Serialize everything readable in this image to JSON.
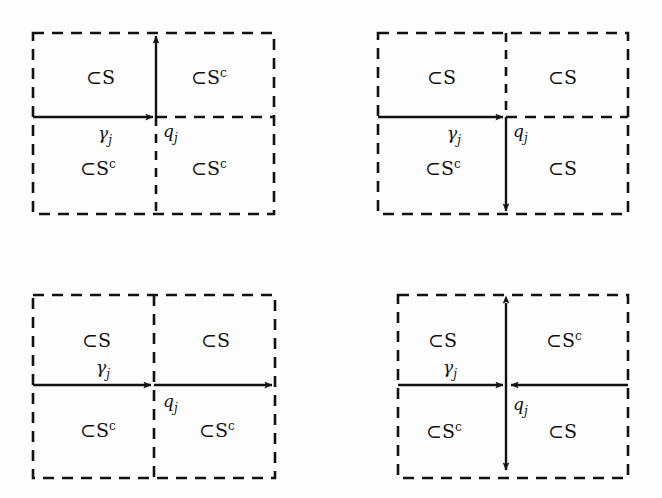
{
  "figure": {
    "caption": "",
    "background_color": "#fdfdfd",
    "ink_color": "#121212",
    "symbols": {
      "subset_in_s": "⊂S",
      "subset_in_s_complement": "⊂S",
      "complement_exponent": "c",
      "curve_label": "γ",
      "curve_subscript": "j",
      "point_label": "q",
      "point_subscript": "j"
    },
    "panels": [
      {
        "id": "panel-1",
        "position": "top-left",
        "quadrants": {
          "top_left": "⊂S",
          "top_right": "⊂S",
          "top_right_sup": "c",
          "bottom_left": "⊂S",
          "bottom_left_sup": "c",
          "bottom_right": "⊂S",
          "bottom_right_sup": "c"
        },
        "labels": {
          "gamma": "γ",
          "gamma_sub": "j",
          "q": "q",
          "q_sub": "j"
        },
        "arrows": {
          "horizontal": "left-edge-to-center-rightward",
          "vertical": "center-to-top-upward"
        }
      },
      {
        "id": "panel-2",
        "position": "top-right",
        "quadrants": {
          "top_left": "⊂S",
          "top_right": "⊂S",
          "bottom_left": "⊂S",
          "bottom_left_sup": "c",
          "bottom_right": "⊂S"
        },
        "labels": {
          "gamma": "γ",
          "gamma_sub": "j",
          "q": "q",
          "q_sub": "j"
        },
        "arrows": {
          "horizontal": "left-edge-to-center-rightward",
          "vertical": "center-to-bottom-downward"
        }
      },
      {
        "id": "panel-3",
        "position": "bottom-left",
        "quadrants": {
          "top_left": "⊂S",
          "top_right": "⊂S",
          "bottom_left": "⊂S",
          "bottom_left_sup": "c",
          "bottom_right": "⊂S",
          "bottom_right_sup": "c"
        },
        "labels": {
          "gamma": "γ",
          "gamma_sub": "j",
          "q": "q",
          "q_sub": "j"
        },
        "arrows": {
          "horizontal": "left-edge-through-center-to-right-edge-rightward-two-heads",
          "vertical": "none"
        }
      },
      {
        "id": "panel-4",
        "position": "bottom-right",
        "quadrants": {
          "top_left": "⊂S",
          "top_right": "⊂S",
          "top_right_sup": "c",
          "bottom_left": "⊂S",
          "bottom_left_sup": "c",
          "bottom_right": "⊂S"
        },
        "labels": {
          "gamma": "γ",
          "gamma_sub": "j",
          "q": "q",
          "q_sub": "j"
        },
        "arrows": {
          "horizontal": "both-edges-inward-to-center",
          "vertical": "center-double-headed-up-and-down"
        }
      }
    ]
  }
}
